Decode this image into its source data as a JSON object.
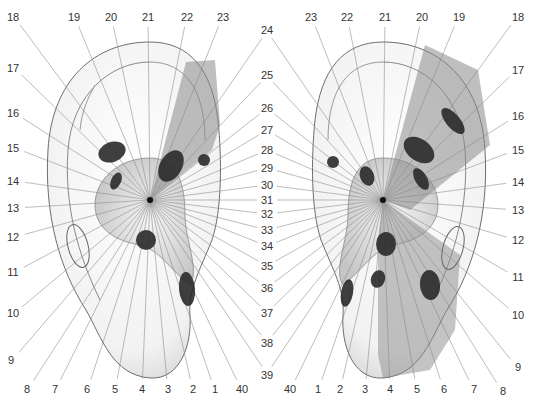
{
  "diagram": {
    "type": "auricular-radial-zone-map",
    "colors": {
      "line": "#8a8a8a",
      "ear_outline": "#6e6e6e",
      "shade": "#9a9a9a",
      "shade_dark": "#6a6a6a",
      "point": "#2a2a2a",
      "label": "#333333",
      "background": "#ffffff"
    },
    "left_ear": {
      "center": [
        150,
        200
      ],
      "labels": [
        {
          "text": "18",
          "x": 13,
          "y": 17
        },
        {
          "text": "17",
          "x": 13,
          "y": 68
        },
        {
          "text": "16",
          "x": 13,
          "y": 113
        },
        {
          "text": "15",
          "x": 13,
          "y": 148
        },
        {
          "text": "14",
          "x": 13,
          "y": 181
        },
        {
          "text": "13",
          "x": 13,
          "y": 208
        },
        {
          "text": "12",
          "x": 13,
          "y": 237
        },
        {
          "text": "11",
          "x": 13,
          "y": 272
        },
        {
          "text": "10",
          "x": 13,
          "y": 313
        },
        {
          "text": "9",
          "x": 11,
          "y": 360
        },
        {
          "text": "19",
          "x": 74,
          "y": 17
        },
        {
          "text": "20",
          "x": 111,
          "y": 17
        },
        {
          "text": "21",
          "x": 148,
          "y": 17
        },
        {
          "text": "22",
          "x": 187,
          "y": 17
        },
        {
          "text": "23",
          "x": 223,
          "y": 17
        },
        {
          "text": "8",
          "x": 27,
          "y": 389
        },
        {
          "text": "7",
          "x": 55,
          "y": 389
        },
        {
          "text": "6",
          "x": 87,
          "y": 389
        },
        {
          "text": "5",
          "x": 115,
          "y": 389
        },
        {
          "text": "4",
          "x": 142,
          "y": 389
        },
        {
          "text": "3",
          "x": 168,
          "y": 389
        },
        {
          "text": "2",
          "x": 193,
          "y": 389
        },
        {
          "text": "1",
          "x": 215,
          "y": 389
        },
        {
          "text": "40",
          "x": 242,
          "y": 389
        }
      ],
      "points": [
        {
          "cx": 112,
          "cy": 152,
          "rx": 14,
          "ry": 10,
          "rot": -20
        },
        {
          "cx": 116,
          "cy": 181,
          "rx": 5,
          "ry": 9,
          "rot": 25
        },
        {
          "cx": 171,
          "cy": 166,
          "rx": 11,
          "ry": 17,
          "rot": 30
        },
        {
          "cx": 204,
          "cy": 160,
          "rx": 6,
          "ry": 6,
          "rot": 0
        },
        {
          "cx": 146,
          "cy": 240,
          "rx": 10,
          "ry": 10,
          "rot": 0
        },
        {
          "cx": 187,
          "cy": 289,
          "rx": 8,
          "ry": 17,
          "rot": -5
        }
      ],
      "rings": [
        {
          "cx": 78,
          "cy": 246,
          "rx": 10,
          "ry": 22,
          "rot": -15
        }
      ]
    },
    "right_ear": {
      "center": [
        383,
        200
      ],
      "labels": [
        {
          "text": "23",
          "x": 311,
          "y": 17
        },
        {
          "text": "22",
          "x": 347,
          "y": 17
        },
        {
          "text": "21",
          "x": 385,
          "y": 17
        },
        {
          "text": "20",
          "x": 422,
          "y": 17
        },
        {
          "text": "19",
          "x": 459,
          "y": 17
        },
        {
          "text": "18",
          "x": 518,
          "y": 17
        },
        {
          "text": "17",
          "x": 518,
          "y": 70
        },
        {
          "text": "16",
          "x": 518,
          "y": 116
        },
        {
          "text": "15",
          "x": 518,
          "y": 150
        },
        {
          "text": "14",
          "x": 518,
          "y": 182
        },
        {
          "text": "13",
          "x": 518,
          "y": 210
        },
        {
          "text": "12",
          "x": 518,
          "y": 240
        },
        {
          "text": "11",
          "x": 518,
          "y": 277
        },
        {
          "text": "10",
          "x": 518,
          "y": 315
        },
        {
          "text": "9",
          "x": 518,
          "y": 367
        },
        {
          "text": "8",
          "x": 503,
          "y": 391
        },
        {
          "text": "40",
          "x": 290,
          "y": 389
        },
        {
          "text": "1",
          "x": 318,
          "y": 389
        },
        {
          "text": "2",
          "x": 340,
          "y": 389
        },
        {
          "text": "3",
          "x": 365,
          "y": 389
        },
        {
          "text": "4",
          "x": 390,
          "y": 389
        },
        {
          "text": "5",
          "x": 417,
          "y": 389
        },
        {
          "text": "6",
          "x": 444,
          "y": 389
        },
        {
          "text": "7",
          "x": 474,
          "y": 389
        }
      ],
      "points": [
        {
          "cx": 453,
          "cy": 121,
          "rx": 7,
          "ry": 16,
          "rot": -40
        },
        {
          "cx": 419,
          "cy": 150,
          "rx": 11,
          "ry": 17,
          "rot": -55
        },
        {
          "cx": 421,
          "cy": 179,
          "rx": 6,
          "ry": 12,
          "rot": -30
        },
        {
          "cx": 333,
          "cy": 162,
          "rx": 6,
          "ry": 6,
          "rot": 0
        },
        {
          "cx": 367,
          "cy": 176,
          "rx": 7,
          "ry": 10,
          "rot": -20
        },
        {
          "cx": 386,
          "cy": 244,
          "rx": 10,
          "ry": 12,
          "rot": 0
        },
        {
          "cx": 378,
          "cy": 279,
          "rx": 7,
          "ry": 9,
          "rot": 20
        },
        {
          "cx": 430,
          "cy": 285,
          "rx": 10,
          "ry": 15,
          "rot": -5
        },
        {
          "cx": 347,
          "cy": 293,
          "rx": 6,
          "ry": 14,
          "rot": 10
        }
      ],
      "rings": [
        {
          "cx": 453,
          "cy": 248,
          "rx": 10,
          "ry": 22,
          "rot": 15
        }
      ]
    },
    "center_labels": [
      {
        "text": "24",
        "x": 267,
        "y": 30
      },
      {
        "text": "25",
        "x": 267,
        "y": 75
      },
      {
        "text": "26",
        "x": 267,
        "y": 108
      },
      {
        "text": "27",
        "x": 267,
        "y": 130
      },
      {
        "text": "28",
        "x": 267,
        "y": 150
      },
      {
        "text": "29",
        "x": 267,
        "y": 168
      },
      {
        "text": "30",
        "x": 267,
        "y": 185
      },
      {
        "text": "31",
        "x": 267,
        "y": 200
      },
      {
        "text": "32",
        "x": 267,
        "y": 214
      },
      {
        "text": "33",
        "x": 267,
        "y": 230
      },
      {
        "text": "34",
        "x": 267,
        "y": 246
      },
      {
        "text": "35",
        "x": 267,
        "y": 266
      },
      {
        "text": "36",
        "x": 267,
        "y": 288
      },
      {
        "text": "37",
        "x": 267,
        "y": 313
      },
      {
        "text": "38",
        "x": 267,
        "y": 343
      },
      {
        "text": "39",
        "x": 267,
        "y": 375
      }
    ]
  }
}
